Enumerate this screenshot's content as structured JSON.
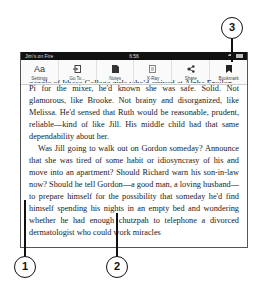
{
  "statusbar": {
    "title": "Jim's on Fire",
    "time": "6:56",
    "icons": [
      "wifi-icon",
      "battery-icon"
    ]
  },
  "toolbar": {
    "items": [
      {
        "label": "Settings",
        "icon": "Aa"
      },
      {
        "label": "Go To...",
        "icon": "goto-icon"
      },
      {
        "label": "Notes",
        "icon": "notes-icon"
      },
      {
        "label": "X-Ray",
        "icon": "xray-icon"
      },
      {
        "label": "Share",
        "icon": "share-icon"
      },
      {
        "label": "Bookmark",
        "icon": "bookmark-icon"
      }
    ]
  },
  "book": {
    "cut_line": "gaggle of Ithaca College girls who'd arrived at Alpha Epsilon",
    "paragraph1": "Pi for the mixer, he'd known she was safe. Solid. Not glamorous, like Brooke. Not brainy and disorganized, like Melissa. He'd sensed that Ruth would be reasonable, prudent, reliable—kind of like Jill. His middle child had that same dependability about her.",
    "paragraph2": "Was Jill going to walk out on Gordon someday? Announce that she was tired of some habit or idiosyncrasy of his and move into an apartment? Should Richard warn his son-in-law now? Should he tell Gordon—a good man, a loving husband—to prepare himself for the possibility that someday he'd find himself spending his nights in an empty bed and wondering whether he had enough chutzpah to telephone a divorced dermatologist who could work miracles"
  },
  "callouts": [
    {
      "number": "1",
      "target": "left-edge-tap-zone"
    },
    {
      "number": "2",
      "target": "center-tap-zone"
    },
    {
      "number": "3",
      "target": "bookmark-button"
    }
  ]
}
